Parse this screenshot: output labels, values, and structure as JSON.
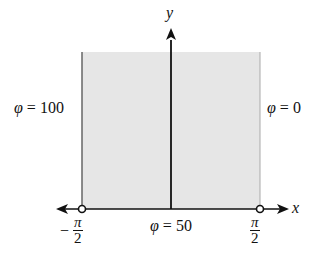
{
  "figure": {
    "axes": {
      "x_label": "x",
      "y_label": "y"
    },
    "boundary_labels": {
      "left": {
        "symbol": "φ",
        "eq": "=",
        "value": "100"
      },
      "right": {
        "symbol": "φ",
        "eq": "=",
        "value": "0"
      },
      "bottom": {
        "symbol": "φ",
        "eq": "=",
        "value": "50"
      }
    },
    "ticks": {
      "left": {
        "sign": "−",
        "numerator": "π",
        "denominator": "2"
      },
      "right": {
        "numerator": "π",
        "denominator": "2"
      }
    },
    "colors": {
      "region_fill": "#e6e6e6",
      "line": "#111111",
      "edge": "#777777"
    }
  }
}
